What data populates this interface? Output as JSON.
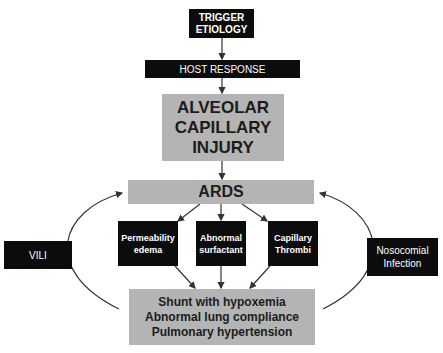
{
  "diagram": {
    "nodes": {
      "trigger": {
        "line1": "TRIGGER",
        "line2": "ETIOLOGY"
      },
      "host_response": {
        "label": "HOST RESPONSE"
      },
      "alveolar": {
        "line1": "ALVEOLAR",
        "line2": "CAPILLARY",
        "line3": "INJURY"
      },
      "ards": {
        "label": "ARDS"
      },
      "permeability": {
        "line1": "Permeability",
        "line2": "edema"
      },
      "surfactant": {
        "line1": "Abnormal",
        "line2": "surfactant"
      },
      "thrombi": {
        "line1": "Capillary",
        "line2": "Thrombi"
      },
      "outcomes": {
        "line1": "Shunt with hypoxemia",
        "line2": "Abnormal lung compliance",
        "line3": "Pulmonary hypertension"
      },
      "vili": {
        "label": "VILI"
      },
      "nosocomial": {
        "line1": "Nosocomial",
        "line2": "Infection"
      }
    },
    "edges": [
      {
        "from": "trigger",
        "to": "host_response"
      },
      {
        "from": "host_response",
        "to": "alveolar"
      },
      {
        "from": "alveolar",
        "to": "ards"
      },
      {
        "from": "ards",
        "to": "permeability"
      },
      {
        "from": "ards",
        "to": "surfactant"
      },
      {
        "from": "ards",
        "to": "thrombi"
      },
      {
        "from": "permeability",
        "to": "outcomes"
      },
      {
        "from": "surfactant",
        "to": "outcomes"
      },
      {
        "from": "thrombi",
        "to": "outcomes"
      },
      {
        "from": "outcomes",
        "to": "ards",
        "via": "vili",
        "shape": "curved-left"
      },
      {
        "from": "outcomes",
        "to": "ards",
        "via": "nosocomial",
        "shape": "curved-right"
      }
    ],
    "colors": {
      "dark_box": "#0c0c0c",
      "gray_box": "#b4b4b4",
      "line": "#333333"
    }
  }
}
